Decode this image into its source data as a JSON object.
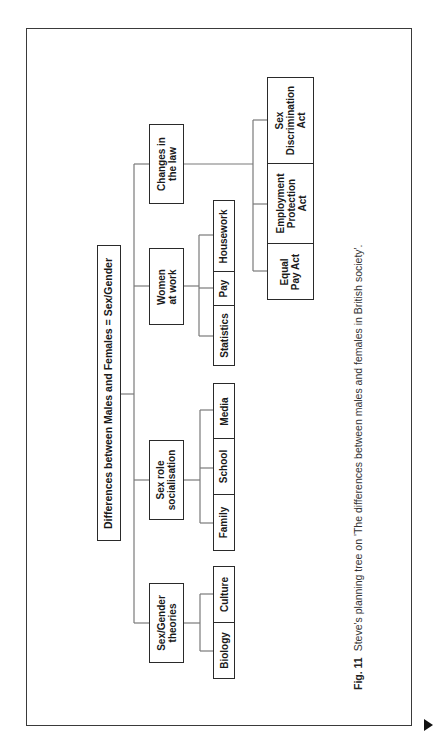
{
  "diagram": {
    "title": "Planning tree",
    "root": {
      "label": "Differences between Males and Females = Sex/Gender"
    },
    "branches": [
      {
        "label": "Sex/Gender\ntheories",
        "children": [
          "Biology",
          "Culture"
        ]
      },
      {
        "label": "Sex role\nsocialisation",
        "children": [
          "Family",
          "School",
          "Media"
        ]
      },
      {
        "label": "Women\nat work",
        "children": [
          "Statistics",
          "Pay",
          "Housework"
        ]
      },
      {
        "label": "Changes in\nthe law",
        "children": [
          "Equal\nPay Act",
          "Employment\nProtection\nAct",
          "Sex\nDiscrimination\nAct"
        ]
      }
    ]
  },
  "caption": {
    "fig_label": "Fig. 11",
    "text": "Steve's planning tree on 'The differences between males and females in British society'."
  },
  "navigation": {
    "next_icon": "triangle-right-icon"
  },
  "colors": {
    "line": "#7a7a7a",
    "box_border": "#2a2a2a",
    "text": "#1a1a1a"
  }
}
